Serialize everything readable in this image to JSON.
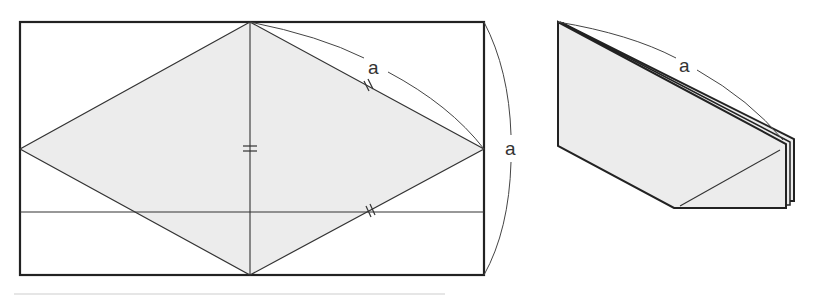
{
  "diagram": {
    "type": "origami-fold-diagram",
    "colors": {
      "stroke": "#222222",
      "fill_paper": "#ececec",
      "background": "#ffffff",
      "label": "#333333"
    },
    "left_figure": {
      "description": "Rectangle with inscribed rhombus, equal-length markers",
      "labels": {
        "top_arc": "a",
        "right_arc": "a"
      },
      "marks": {
        "center_vertical": "=",
        "upper_right_edge": "//",
        "lower_right_edge": "//"
      }
    },
    "right_figure": {
      "description": "Folded paper, 3D view",
      "labels": {
        "top_arc": "a"
      }
    }
  }
}
